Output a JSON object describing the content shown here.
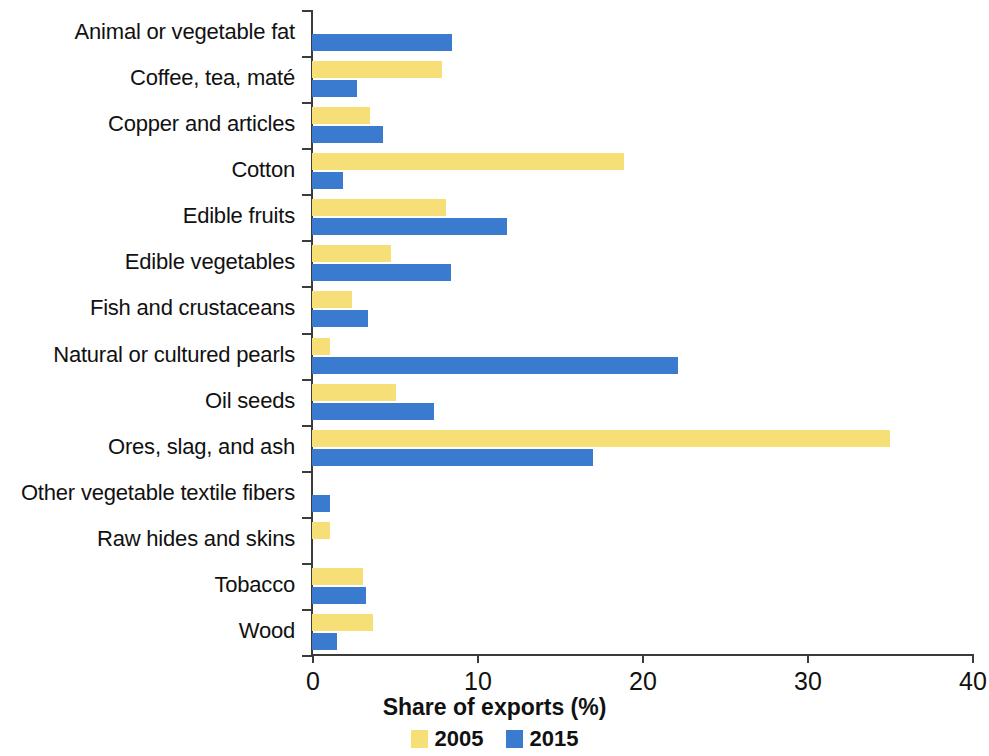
{
  "chart_data": {
    "type": "bar",
    "orientation": "horizontal",
    "title": "",
    "xlabel": "Share of exports (%)",
    "ylabel": "",
    "xlim": [
      0,
      40
    ],
    "xticks": [
      0,
      10,
      20,
      30,
      40
    ],
    "xtick_labels": [
      "0",
      "10",
      "20",
      "30",
      "40"
    ],
    "grid": false,
    "legend_position": "bottom",
    "categories": [
      "Animal or vegetable fat",
      "Coffee, tea, maté",
      "Copper and articles",
      "Cotton",
      "Edible fruits",
      "Edible vegetables",
      "Fish and crustaceans",
      "Natural or cultured pearls",
      "Oil seeds",
      "Ores, slag, and ash",
      "Other vegetable textile fibers",
      "Raw hides and skins",
      "Tobacco",
      "Wood"
    ],
    "series": [
      {
        "name": "2005",
        "color": "#f7df78",
        "values": [
          0.0,
          7.9,
          3.5,
          18.9,
          8.1,
          4.8,
          2.4,
          1.1,
          5.1,
          35.0,
          0.0,
          1.1,
          3.1,
          3.7
        ]
      },
      {
        "name": "2015",
        "color": "#3a7bd0",
        "values": [
          8.5,
          2.7,
          4.3,
          1.9,
          11.8,
          8.4,
          3.4,
          22.2,
          7.4,
          17.0,
          1.1,
          0.0,
          3.3,
          1.5
        ]
      }
    ],
    "legend": [
      "2005",
      "2015"
    ]
  }
}
